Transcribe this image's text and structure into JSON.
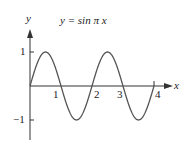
{
  "chart_data": {
    "type": "line",
    "title": "y = sin π x",
    "xlabel": "x",
    "ylabel": "y",
    "xlim": [
      0,
      4
    ],
    "ylim": [
      -1,
      1
    ],
    "x_ticks": [
      "1",
      "2",
      "3",
      "4"
    ],
    "y_ticks": [
      "1",
      "−1"
    ],
    "series": [
      {
        "name": "sin πx",
        "x": [
          0,
          0.5,
          1,
          1.5,
          2,
          2.5,
          3,
          3.5,
          4
        ],
        "values": [
          0,
          1,
          0,
          -1,
          0,
          1,
          0,
          -1,
          0
        ]
      }
    ],
    "grid": false,
    "legend": "none",
    "color": "#555555"
  },
  "labels": {
    "title": "y = sin π x",
    "x_axis": "x",
    "y_axis": "y",
    "x1": "1",
    "x2": "2",
    "x3": "3",
    "x4": "4",
    "y1": "1",
    "ym1": "−1"
  }
}
